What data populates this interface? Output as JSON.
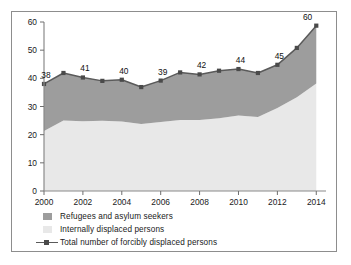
{
  "chart_data": {
    "type": "area",
    "title": "",
    "subtitle": "",
    "xlabel": "",
    "ylabel": "",
    "xlim": [
      2000,
      2014.5
    ],
    "ylim": [
      0,
      60
    ],
    "y_ticks": [
      0,
      10,
      20,
      30,
      40,
      50,
      60
    ],
    "x_ticks": [
      2000,
      2002,
      2004,
      2006,
      2008,
      2010,
      2012,
      2014
    ],
    "x": [
      2000,
      2001,
      2002,
      2003,
      2004,
      2005,
      2006,
      2007,
      2008,
      2009,
      2010,
      2011,
      2012,
      2013,
      2014
    ],
    "grid": false,
    "legend_position": "below",
    "stacked": true,
    "series": [
      {
        "name": "Internally displaced persons",
        "color": "#e8e8e8",
        "values": [
          21.3,
          25.0,
          24.8,
          24.9,
          24.7,
          23.8,
          24.5,
          25.2,
          25.2,
          25.8,
          26.8,
          26.3,
          29.5,
          33.3,
          38.2
        ]
      },
      {
        "name": "Refugees and asylum seekers",
        "color": "#9d9d9d",
        "values": [
          16.7,
          16.9,
          15.5,
          14.2,
          14.8,
          13.1,
          14.7,
          16.9,
          16.2,
          16.9,
          16.5,
          15.6,
          15.3,
          17.5,
          20.5
        ]
      }
    ],
    "total_line": {
      "name": "Total number of forcibly displaced persons",
      "color": "#5a5a5a",
      "marker": "square",
      "values": [
        38.0,
        41.9,
        40.3,
        39.1,
        39.5,
        36.9,
        39.2,
        42.1,
        41.4,
        42.7,
        43.3,
        41.9,
        44.8,
        50.8,
        58.7
      ]
    },
    "data_labels": [
      {
        "x": 2000,
        "value": 38
      },
      {
        "x": 2002,
        "value": 41
      },
      {
        "x": 2004,
        "value": 40
      },
      {
        "x": 2006,
        "value": 39
      },
      {
        "x": 2008,
        "value": 42
      },
      {
        "x": 2010,
        "value": 44
      },
      {
        "x": 2012,
        "value": 45
      },
      {
        "x": 2014,
        "value": 60
      }
    ]
  },
  "legend": {
    "items": [
      {
        "label": "Refugees and asylum seekers",
        "icon": "square-swatch-dark"
      },
      {
        "label": "Internally displaced persons",
        "icon": "square-swatch-light"
      },
      {
        "label": "Total number of forcibly displaced persons",
        "icon": "line-marker-swatch"
      }
    ]
  },
  "axis": {
    "y_labels": [
      "60",
      "50",
      "40",
      "30",
      "20",
      "10",
      "0"
    ],
    "x_labels": [
      "2000",
      "2002",
      "2004",
      "2006",
      "2008",
      "2010",
      "2012",
      "2014"
    ]
  }
}
